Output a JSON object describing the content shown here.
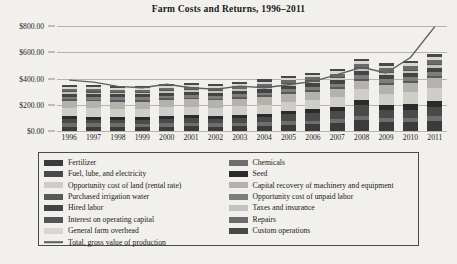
{
  "chart_data": {
    "type": "bar",
    "title": "Farm Costs and Returns, 1996–2011",
    "xlabel": "",
    "ylabel": "",
    "ylim": [
      0,
      800
    ],
    "yticks": [
      0,
      200,
      400,
      600,
      800
    ],
    "ytick_labels": [
      "$0.00",
      "$200.00",
      "$400.00",
      "$600.00",
      "$800.00"
    ],
    "grid": true,
    "legend_position": "bottom",
    "stacked": true,
    "categories": [
      "1996",
      "1997",
      "1998",
      "1999",
      "2000",
      "2001",
      "2002",
      "2003",
      "2004",
      "2005",
      "2006",
      "2007",
      "2008",
      "2009",
      "2010",
      "2011"
    ],
    "series": [
      {
        "name": "Fertilizer",
        "color": "#3b3b3b",
        "values": [
          34,
          33,
          33,
          32,
          34,
          38,
          34,
          36,
          40,
          47,
          50,
          58,
          84,
          70,
          66,
          78
        ]
      },
      {
        "name": "Chemicals",
        "color": "#6e6e6e",
        "values": [
          26,
          26,
          26,
          25,
          25,
          25,
          25,
          26,
          27,
          28,
          29,
          30,
          32,
          32,
          33,
          34
        ]
      },
      {
        "name": "Fuel, lube, and electricity",
        "color": "#4a4a4a",
        "values": [
          30,
          28,
          24,
          25,
          33,
          34,
          29,
          35,
          40,
          51,
          57,
          62,
          80,
          55,
          62,
          72
        ]
      },
      {
        "name": "Seed",
        "color": "#2b2b2b",
        "values": [
          22,
          22,
          23,
          23,
          23,
          24,
          24,
          25,
          26,
          28,
          30,
          33,
          38,
          40,
          42,
          46
        ]
      },
      {
        "name": "Opportunity cost of land (rental rate)",
        "color": "#cfcdc8",
        "values": [
          62,
          63,
          64,
          64,
          65,
          65,
          65,
          66,
          68,
          70,
          72,
          76,
          84,
          88,
          92,
          100
        ]
      },
      {
        "name": "Capital recovery of machinery and equipment",
        "color": "#b4b2ad",
        "values": [
          55,
          55,
          55,
          55,
          55,
          55,
          56,
          56,
          57,
          58,
          60,
          62,
          66,
          68,
          70,
          74
        ]
      },
      {
        "name": "Purchased irrigation water",
        "color": "#595959",
        "values": [
          13,
          13,
          13,
          13,
          13,
          13,
          13,
          14,
          14,
          14,
          15,
          15,
          16,
          16,
          17,
          18
        ]
      },
      {
        "name": "Opportunity cost of unpaid labor",
        "color": "#7d7d7d",
        "values": [
          20,
          20,
          20,
          20,
          21,
          21,
          21,
          22,
          22,
          23,
          24,
          25,
          26,
          27,
          28,
          29
        ]
      },
      {
        "name": "Hired labor",
        "color": "#444444",
        "values": [
          22,
          22,
          22,
          23,
          23,
          23,
          24,
          24,
          25,
          26,
          27,
          28,
          30,
          30,
          31,
          33
        ]
      },
      {
        "name": "Taxes and insurance",
        "color": "#c4c2bd",
        "values": [
          12,
          12,
          12,
          12,
          12,
          12,
          13,
          13,
          13,
          14,
          14,
          15,
          16,
          16,
          17,
          18
        ]
      },
      {
        "name": "Interest on operating capital",
        "color": "#555555",
        "values": [
          8,
          8,
          7,
          7,
          8,
          8,
          7,
          7,
          8,
          9,
          10,
          11,
          13,
          9,
          9,
          11
        ]
      },
      {
        "name": "Repairs",
        "color": "#6a6a6a",
        "values": [
          18,
          18,
          18,
          18,
          19,
          19,
          19,
          20,
          21,
          22,
          23,
          24,
          26,
          27,
          28,
          30
        ]
      },
      {
        "name": "General farm overhead",
        "color": "#d8d6d1",
        "values": [
          15,
          15,
          15,
          15,
          15,
          16,
          16,
          16,
          17,
          17,
          18,
          19,
          20,
          21,
          22,
          23
        ]
      },
      {
        "name": "Custom operations",
        "color": "#484848",
        "values": [
          14,
          14,
          14,
          14,
          14,
          15,
          15,
          15,
          16,
          16,
          17,
          18,
          19,
          20,
          21,
          22
        ]
      }
    ],
    "line_series": {
      "name": "Total, gross value of production",
      "color": "#5f5f5f",
      "values": [
        388,
        372,
        340,
        330,
        356,
        330,
        318,
        342,
        330,
        352,
        378,
        430,
        486,
        442,
        560,
        795
      ]
    }
  },
  "legend": {
    "left_column": [
      "Fertilizer",
      "Fuel, lube, and electricity",
      "Opportunity cost of land (rental rate)",
      "Purchased irrigation water",
      "Hired labor",
      "Interest on operating capital",
      "General farm overhead"
    ],
    "right_column": [
      "Chemicals",
      "Seed",
      "Capital recovery of machinery and equipment",
      "Opportunity cost of unpaid labor",
      "Taxes and insurance",
      "Repairs",
      "Custom operations"
    ],
    "line_entry": "Total, gross value of production"
  }
}
